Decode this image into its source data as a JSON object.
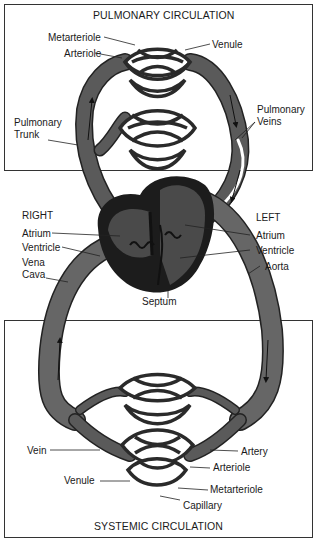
{
  "titles": {
    "pulmonary": "PULMONARY CIRCULATION",
    "systemic": "SYSTEMIC CIRCULATION"
  },
  "pulmonary_labels": {
    "metarteriole": "Metarteriole",
    "arteriole": "Arteriole",
    "venule": "Venule",
    "pulmonary_trunk_1": "Pulmonary",
    "pulmonary_trunk_2": "Trunk",
    "pulmonary_veins_1": "Pulmonary",
    "pulmonary_veins_2": "Veins"
  },
  "heart_labels": {
    "right": "RIGHT",
    "right_atrium": "Atrium",
    "right_ventricle": "Ventricle",
    "vena_cava_1": "Vena",
    "vena_cava_2": "Cava",
    "left": "LEFT",
    "left_atrium": "Atrium",
    "left_ventricle": "Ventricle",
    "aorta": "Aorta",
    "septum": "Septum"
  },
  "systemic_labels": {
    "vein": "Vein",
    "artery": "Artery",
    "arteriole": "Arteriole",
    "venule": "Venule",
    "metarteriole": "Metarteriole",
    "capillary": "Capillary"
  },
  "colors": {
    "vessel": "#555555",
    "vessel_outline": "#222222",
    "heart_dark": "#1c1c1c",
    "heart_mid": "#4a4a4a",
    "box_border": "#333333",
    "background": "#ffffff"
  }
}
